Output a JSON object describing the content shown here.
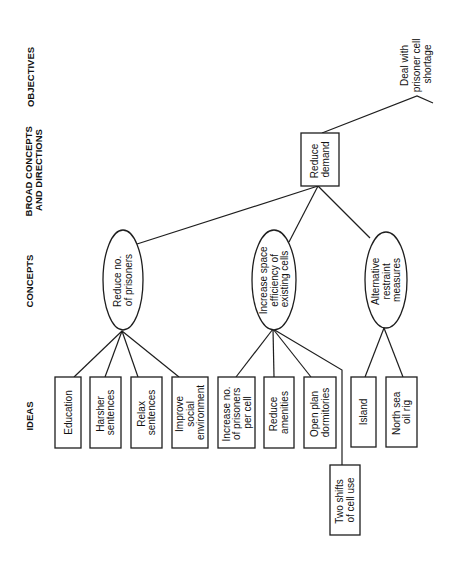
{
  "headers": {
    "objectives": "OBJECTIVES",
    "broad_concepts": [
      "BROAD CONCEPTS",
      "AND DIRECTIONS"
    ],
    "concepts": "CONCEPTS",
    "ideas": "IDEAS"
  },
  "objective": {
    "lines": [
      "Deal with",
      "prisoner cell",
      "shortage"
    ]
  },
  "broad_concept": {
    "lines": [
      "Reduce",
      "demand"
    ]
  },
  "concepts": [
    {
      "lines": [
        "Reduce no.",
        "of prisoners"
      ]
    },
    {
      "lines": [
        "Increase space",
        "efficiency of",
        "existing cells"
      ]
    },
    {
      "lines": [
        "Alternative",
        "restraint",
        "measures"
      ]
    }
  ],
  "ideas": [
    {
      "lines": [
        "Education"
      ]
    },
    {
      "lines": [
        "Harsher",
        "sentences"
      ]
    },
    {
      "lines": [
        "Relax",
        "sentences"
      ]
    },
    {
      "lines": [
        "Improve",
        "social",
        "environment"
      ]
    },
    {
      "lines": [
        "Increase no.",
        "of prisoners",
        "per cell"
      ]
    },
    {
      "lines": [
        "Reduce",
        "amenities"
      ]
    },
    {
      "lines": [
        "Open plan",
        "dormitories"
      ]
    },
    {
      "lines": [
        "Two shifts",
        "of cell use"
      ]
    },
    {
      "lines": [
        "Island"
      ]
    },
    {
      "lines": [
        "North sea",
        "oil rig"
      ]
    }
  ],
  "colors": {
    "line": "#1e1e1e",
    "text": "#111111",
    "background": "#ffffff"
  }
}
